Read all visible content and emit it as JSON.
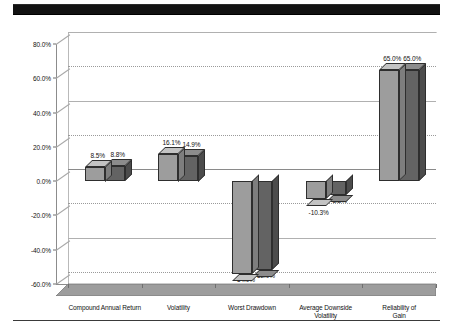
{
  "header": {
    "banner_color": "#121212"
  },
  "chart_data": {
    "type": "bar",
    "title": "",
    "subtitle": "",
    "xlabel": "",
    "ylabel": "",
    "ylim": [
      -60,
      80
    ],
    "ytick_step": 20,
    "grid": true,
    "legend": "none",
    "value_label_format": "percent-one-decimal",
    "categories": [
      "Compound Annual Return",
      "Volatility",
      "Worst Drawdown",
      "Average Downside\nVolatility",
      "Reliability of Gain"
    ],
    "ytick_labels": [
      "80.0%",
      "60.0%",
      "40.0%",
      "20.0%",
      "0.0%",
      "-20.0%",
      "-40.0%",
      "-60.0%"
    ],
    "ytick_values": [
      80,
      60,
      40,
      20,
      0,
      -20,
      -40,
      -60
    ],
    "series": [
      {
        "name": "Series 1",
        "color": "#9d9d9d",
        "values": [
          8.5,
          16.1,
          -54.0,
          -10.3,
          65.0
        ],
        "labels": [
          "8.5%",
          "16.1%",
          "-54.0%",
          "-10.3%",
          "65.0%"
        ]
      },
      {
        "name": "Series 2",
        "color": "#636363",
        "values": [
          8.8,
          14.9,
          -52.0,
          -8.2,
          65.0
        ],
        "labels": [
          "8.8%",
          "14.9%",
          "-52.0%",
          "-8.2%",
          "65.0%"
        ]
      }
    ]
  }
}
